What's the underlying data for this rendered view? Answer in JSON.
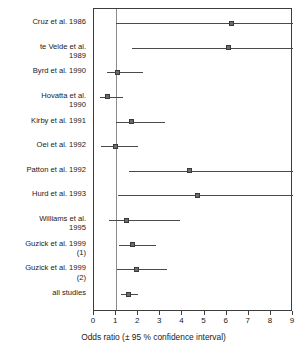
{
  "chart_data": {
    "type": "forest",
    "title": "",
    "xlabel": "Odds ratio (± 95 % confidence interval)",
    "ylabel": "",
    "xlim": [
      0,
      9
    ],
    "xticks": [
      0,
      1,
      2,
      3,
      4,
      5,
      6,
      7,
      8,
      9
    ],
    "xtick_labels": [
      "0",
      "1",
      "2",
      "3",
      "4",
      "5",
      "6",
      "7",
      "8",
      "9"
    ],
    "grid": false,
    "legend": "none",
    "reference_line": 1,
    "effect_measure": "Odds ratio",
    "categories": [
      "Cruz et al. 1986",
      "te Velde et al.\n1989",
      "Byrd et al. 1990",
      "Hovatta et al.\n1990",
      "Kirby et al. 1991",
      "Oei et al. 1992",
      "Patton et al. 1992",
      "Hurd et al. 1993",
      "Williams et al.\n1995",
      "Guzick et al. 1999\n(1)",
      "Guzick et al. 1999\n(2)",
      "all studies"
    ],
    "points": [
      {
        "label": "Cruz et al. 1986",
        "estimate": 6.2,
        "ci_low": 1.0,
        "ci_high": 9.0,
        "ci_high_truncated": true
      },
      {
        "label": "te Velde et al. 1989",
        "estimate": 6.1,
        "ci_low": 1.7,
        "ci_high": 9.0,
        "ci_high_truncated": true
      },
      {
        "label": "Byrd et al. 1990",
        "estimate": 1.05,
        "ci_low": 0.6,
        "ci_high": 2.2,
        "ci_high_truncated": false
      },
      {
        "label": "Hovatta et al. 1990",
        "estimate": 0.6,
        "ci_low": 0.28,
        "ci_high": 1.3,
        "ci_high_truncated": false
      },
      {
        "label": "Kirby et al. 1991",
        "estimate": 1.7,
        "ci_low": 1.0,
        "ci_high": 3.2,
        "ci_high_truncated": false
      },
      {
        "label": "Oei et al. 1992",
        "estimate": 0.95,
        "ci_low": 0.32,
        "ci_high": 2.0,
        "ci_high_truncated": false
      },
      {
        "label": "Patton et al. 1992",
        "estimate": 4.3,
        "ci_low": 1.6,
        "ci_high": 9.0,
        "ci_high_truncated": true
      },
      {
        "label": "Hurd et al. 1993",
        "estimate": 4.7,
        "ci_low": 1.1,
        "ci_high": 9.0,
        "ci_high_truncated": true
      },
      {
        "label": "Williams et al. 1995",
        "estimate": 1.45,
        "ci_low": 0.68,
        "ci_high": 3.9,
        "ci_high_truncated": false
      },
      {
        "label": "Guzick et al. 1999 (1)",
        "estimate": 1.75,
        "ci_low": 1.15,
        "ci_high": 2.8,
        "ci_high_truncated": false
      },
      {
        "label": "Guzick et al. 1999 (2)",
        "estimate": 1.9,
        "ci_low": 1.05,
        "ci_high": 3.3,
        "ci_high_truncated": false
      },
      {
        "label": "all studies",
        "estimate": 1.55,
        "ci_low": 1.2,
        "ci_high": 2.0,
        "ci_high_truncated": false
      }
    ],
    "colors": {
      "marker": "#6b6b6b",
      "marker_edge": "#3a3a3a",
      "whisker": "#4a4a4a",
      "frame": "#3c3c3c",
      "reference_line": "#8c8c8c",
      "text": "#1a1a1a",
      "background": "#ffffff"
    }
  }
}
